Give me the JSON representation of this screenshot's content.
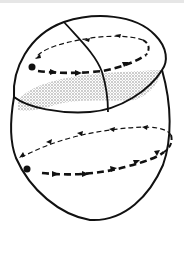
{
  "figure": {
    "colors": {
      "stroke": "#111111",
      "shading": "#c8c8c8",
      "background": "#ffffff"
    },
    "upper_loop": {
      "start_marker": "filled-dot",
      "front_arrows": "bold dashed, pointing right",
      "back_arrows": "thin dashed, pointing left"
    },
    "lower_loop": {
      "start_marker": "filled-dot",
      "front_arrows": "bold dashed, pointing right",
      "back_arrows": "thin dashed, pointing left"
    }
  }
}
